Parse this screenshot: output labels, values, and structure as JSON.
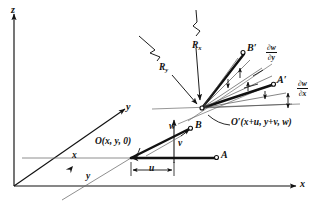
{
  "figure": {
    "type": "engineering-kinematics-diagram",
    "background_color": "#ffffff",
    "ink_color": "#111111",
    "thin_line_color": "#555555"
  },
  "axes": {
    "z_label": "z",
    "y_label": "y",
    "x_label": "x"
  },
  "points": {
    "origin_label": "O(x, y, 0)",
    "displaced_origin_label": "O′(x+u, y+v, w)",
    "a_label": "A",
    "b_label": "B",
    "a_prime_label": "A′",
    "b_prime_label": "B′"
  },
  "displacements": {
    "u_label": "u",
    "v_label": "v",
    "w_label": "w",
    "x_distance_label": "x",
    "y_distance_label": "y"
  },
  "radii": {
    "rx_label": "R",
    "rx_subscript": "x",
    "ry_label": "R",
    "ry_subscript": "y"
  },
  "slopes": {
    "dw_dx": {
      "numerator": "∂w",
      "denominator": "∂x"
    },
    "dw_dy": {
      "numerator": "∂w",
      "denominator": "∂y"
    }
  }
}
